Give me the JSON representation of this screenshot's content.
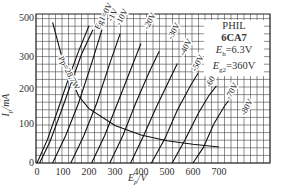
{
  "chart_data": {
    "type": "line",
    "title": "PHIL 6CA7",
    "annotations": [
      "PHIL",
      "6CA7",
      "Eh=6.3V",
      "Eg2=360V",
      "Pp=28.7W"
    ],
    "xlabel": "Ep/V",
    "ylabel": "Ip/mA",
    "x_ticks": [
      0,
      100,
      200,
      300,
      400,
      500,
      600,
      700
    ],
    "y_ticks": [
      0,
      100,
      200,
      300,
      500
    ],
    "xlim": [
      0,
      900
    ],
    "ylim": [
      0,
      500
    ],
    "grid": true,
    "series": [
      {
        "name": "Eg1=0V",
        "x": [
          0,
          40,
          80,
          120,
          160,
          200
        ],
        "y": [
          0,
          60,
          140,
          230,
          330,
          460
        ]
      },
      {
        "name": "-1V",
        "x": [
          10,
          50,
          90,
          130,
          170,
          215
        ],
        "y": [
          0,
          55,
          130,
          215,
          310,
          440
        ]
      },
      {
        "name": "-10V",
        "x": [
          60,
          110,
          160,
          210,
          250
        ],
        "y": [
          0,
          70,
          160,
          280,
          440
        ]
      },
      {
        "name": "-20V",
        "x": [
          130,
          180,
          230,
          280,
          320
        ],
        "y": [
          0,
          70,
          160,
          280,
          420
        ]
      },
      {
        "name": "-30V",
        "x": [
          210,
          260,
          310,
          360,
          400
        ],
        "y": [
          0,
          70,
          160,
          260,
          370
        ]
      },
      {
        "name": "-40V",
        "x": [
          280,
          330,
          380,
          430,
          470
        ],
        "y": [
          0,
          70,
          160,
          250,
          330
        ]
      },
      {
        "name": "-50V",
        "x": [
          360,
          410,
          460,
          510,
          540
        ],
        "y": [
          0,
          70,
          150,
          230,
          280
        ]
      },
      {
        "name": "-60V",
        "x": [
          440,
          490,
          540,
          590,
          620
        ],
        "y": [
          0,
          60,
          140,
          210,
          250
        ]
      },
      {
        "name": "-70V",
        "x": [
          520,
          570,
          620,
          660,
          690
        ],
        "y": [
          0,
          60,
          130,
          180,
          210
        ]
      },
      {
        "name": "-80V",
        "x": [
          600,
          640,
          680,
          720,
          750
        ],
        "y": [
          0,
          40,
          100,
          150,
          180
        ]
      },
      {
        "name": "Pp=28.7W",
        "x": [
          60,
          100,
          160,
          200,
          300,
          400,
          500,
          600,
          700
        ],
        "y": [
          478,
          287,
          180,
          144,
          96,
          72,
          57,
          48,
          41
        ]
      }
    ]
  },
  "labels": {
    "info_brand": "PHIL",
    "info_tube": "6CA7",
    "info_eh_sym": "E",
    "info_eh_sub": "h",
    "info_eh_val": "=6.3V",
    "info_eg2_sym": "E",
    "info_eg2_sub": "g2",
    "info_eg2_val": "=360V",
    "ylabel": "Ip/mA",
    "xlabel": "Ep/V"
  }
}
